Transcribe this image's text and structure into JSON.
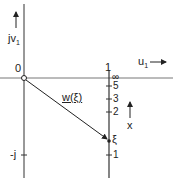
{
  "diagram": {
    "vertical_axis_label": "jv",
    "vertical_axis_sub": "1",
    "horizontal_axis_label": "u",
    "horizontal_axis_sub": "1",
    "origin_label": "0",
    "neg_j_label": "-j",
    "line_top_label": "1",
    "infinity_label": "∞",
    "ticks": [
      "5",
      "3",
      "2",
      "1"
    ],
    "vector_label": "w(ξ)",
    "point_label": "ξ",
    "x_label": "x"
  }
}
